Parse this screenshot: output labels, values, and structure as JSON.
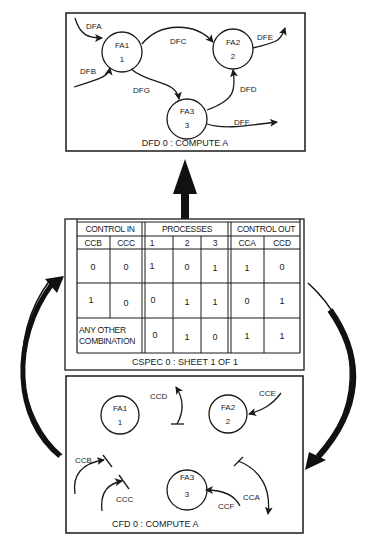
{
  "dfd": {
    "caption": "DFD 0  :  COMPUTE A",
    "processes": [
      {
        "name": "FA1",
        "number": "1"
      },
      {
        "name": "FA2",
        "number": "2"
      },
      {
        "name": "FA3",
        "number": "3"
      }
    ],
    "flows": {
      "dfa": "DFA",
      "dfb": "DFB",
      "dfc": "DFC",
      "dfd": "DFD",
      "dfe": "DFE",
      "dff": "DFF",
      "dfg": "DFG"
    }
  },
  "cspec": {
    "caption": "CSPEC 0 : SHEET 1 OF 1",
    "groups": {
      "control_in": "CONTROL  IN",
      "processes": "PROCESSES",
      "control_out": "CONTROL OUT"
    },
    "columns": [
      "CCB",
      "CCC",
      "1",
      "2",
      "3",
      "CCA",
      "CCD"
    ],
    "rows": [
      {
        "ccb": "0",
        "ccc": "0",
        "p1": "1",
        "p2": "0",
        "p3": "1",
        "cca": "1",
        "ccd": "0"
      },
      {
        "ccb": "1",
        "ccc": "0",
        "p1": "0",
        "p2": "1",
        "p3": "1",
        "cca": "0",
        "ccd": "1"
      },
      {
        "input_line1": "ANY OTHER",
        "input_line2": "COMBINATION",
        "p1": "0",
        "p2": "1",
        "p3": "0",
        "cca": "1",
        "ccd": "1"
      }
    ]
  },
  "cfd": {
    "caption": "CFD 0  :  COMPUTE A",
    "processes": [
      {
        "name": "FA1",
        "number": "1"
      },
      {
        "name": "FA2",
        "number": "2"
      },
      {
        "name": "FA3",
        "number": "3"
      }
    ],
    "flows": {
      "ccb": "CCB",
      "ccc": "CCC",
      "ccd": "CCD",
      "cce": "CCE",
      "ccf": "CCF",
      "cca": "CCA"
    }
  }
}
